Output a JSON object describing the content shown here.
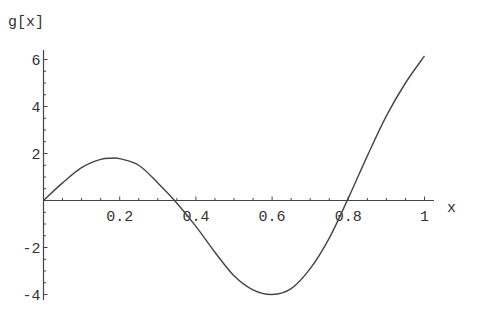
{
  "chart_data": {
    "type": "line",
    "title": "",
    "xlabel": "x",
    "ylabel": "g[x]",
    "xlim": [
      0,
      1.0
    ],
    "ylim": [
      -4.2,
      6.5
    ],
    "grid": false,
    "legend": null,
    "x_ticks": [
      0.2,
      0.4,
      0.6,
      0.8,
      1
    ],
    "x_tick_labels": [
      "0.2",
      "0.4",
      "0.6",
      "0.8",
      "1"
    ],
    "y_ticks": [
      -4,
      -2,
      2,
      4,
      6
    ],
    "y_tick_labels": [
      "-4",
      "-2",
      "2",
      "4",
      "6"
    ],
    "series": [
      {
        "name": "g[x]",
        "x": [
          0,
          0.05,
          0.1,
          0.15,
          0.18,
          0.2,
          0.25,
          0.3,
          0.344,
          0.4,
          0.45,
          0.5,
          0.55,
          0.6,
          0.65,
          0.7,
          0.75,
          0.8,
          0.85,
          0.9,
          0.95,
          1.0
        ],
        "y": [
          0,
          0.75,
          1.4,
          1.75,
          1.8,
          1.78,
          1.5,
          0.75,
          0,
          -1.1,
          -2.2,
          -3.2,
          -3.8,
          -4.0,
          -3.75,
          -2.9,
          -1.6,
          0.1,
          1.9,
          3.6,
          5.0,
          6.15
        ]
      }
    ]
  }
}
